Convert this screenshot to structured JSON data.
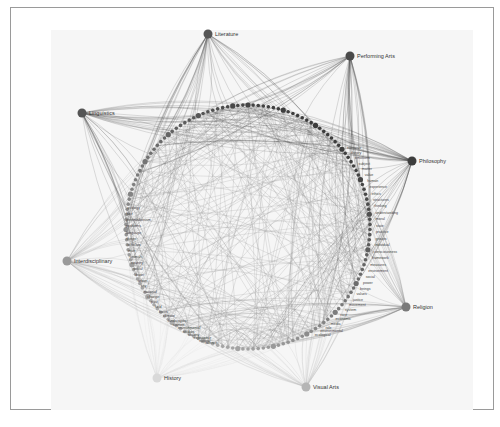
{
  "figure": {
    "type": "radial network diagram",
    "hubs": [
      {
        "label": "Literature",
        "x": 208,
        "y": 34,
        "color": "#555555"
      },
      {
        "label": "Performing Arts",
        "x": 350,
        "y": 56,
        "color": "#4a4a4a"
      },
      {
        "label": "Philosophy",
        "x": 412,
        "y": 161,
        "color": "#3d3d3d"
      },
      {
        "label": "Religion",
        "x": 406,
        "y": 307,
        "color": "#7a7a7a"
      },
      {
        "label": "Visual Arts",
        "x": 306,
        "y": 387,
        "color": "#b5b5b5"
      },
      {
        "label": "History",
        "x": 157,
        "y": 378,
        "color": "#d9d9d9"
      },
      {
        "label": "Interdisciplinary",
        "x": 67,
        "y": 261,
        "color": "#9a9a9a"
      },
      {
        "label": "Linguistics",
        "x": 82,
        "y": 113,
        "color": "#555555"
      }
    ],
    "ring": {
      "cx": 248,
      "cy": 227,
      "r": 122
    },
    "terms_left": [
      "ecology",
      "fact",
      "postmodernism",
      "problems",
      "language",
      "things",
      "scholars",
      "man",
      "animals",
      "country",
      "social",
      "water",
      "urban",
      "city",
      "national",
      "change",
      "past",
      "field",
      "focus",
      "climate",
      "landscapes",
      "women",
      "environmental",
      "studies",
      "society",
      "experience",
      "natural",
      "science"
    ],
    "terms_right": [
      "narrative",
      "theory",
      "emotions",
      "subject",
      "matter",
      "value",
      "human",
      "experience",
      "ethics",
      "structures",
      "thinking",
      "understanding",
      "moral",
      "state",
      "practice",
      "groups",
      "individual",
      "consciousness",
      "framework",
      "measures",
      "environment",
      "social",
      "power",
      "beings",
      "values",
      "justice",
      "movement",
      "system",
      "race",
      "economic",
      "media",
      "role",
      "environmental",
      "ecological"
    ],
    "terms_top": [
      "literature",
      "literary",
      "politics",
      "nature",
      "global",
      "spaces",
      "modern",
      "research",
      "space"
    ]
  }
}
